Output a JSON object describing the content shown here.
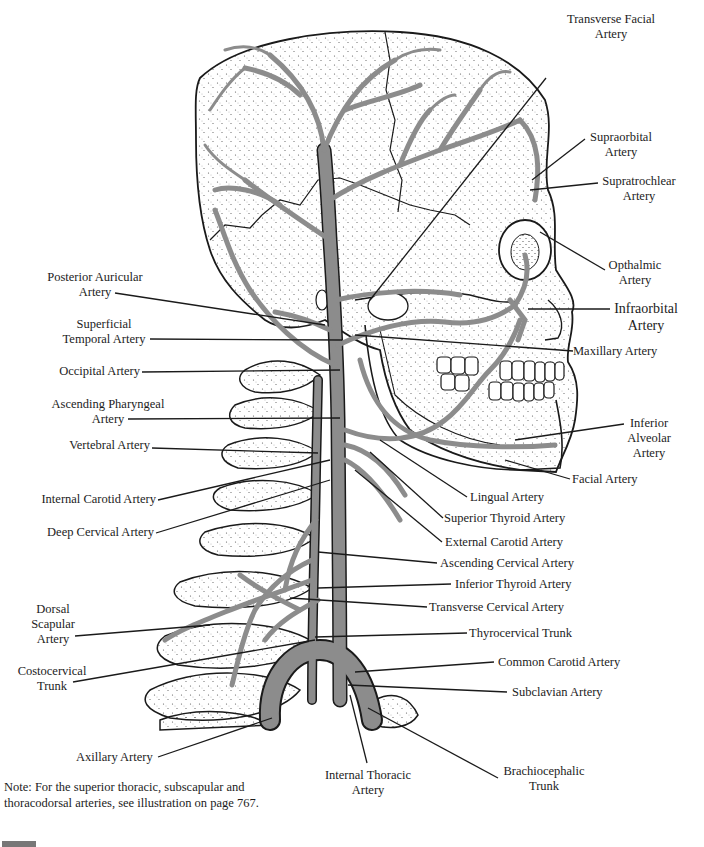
{
  "figure": {
    "colors": {
      "artery_fill": "#8c8c8c",
      "outline": "#1a1a1a",
      "stipple": "#555555",
      "background": "#ffffff",
      "page_tab": "#777777"
    }
  },
  "labels_right": [
    {
      "id": "transverse-facial",
      "line1": "Transverse Facial",
      "line2": "Artery"
    },
    {
      "id": "supraorbital",
      "line1": "Supraorbital",
      "line2": "Artery"
    },
    {
      "id": "supratrochlear",
      "line1": "Supratrochlear",
      "line2": "Artery"
    },
    {
      "id": "opthalmic",
      "line1": "Opthalmic",
      "line2": "Artery"
    },
    {
      "id": "infraorbital",
      "line1": "Infraorbital",
      "line2": "Artery"
    },
    {
      "id": "maxillary",
      "line1": "Maxillary Artery"
    },
    {
      "id": "inferior-alveolar",
      "line1": "Inferior",
      "line2": "Alveolar",
      "line3": "Artery"
    },
    {
      "id": "facial",
      "line1": "Facial Artery"
    },
    {
      "id": "lingual",
      "line1": "Lingual Artery"
    },
    {
      "id": "superior-thyroid",
      "line1": "Superior Thyroid Artery"
    },
    {
      "id": "external-carotid",
      "line1": "External Carotid Artery"
    },
    {
      "id": "ascending-cervical",
      "line1": "Ascending Cervical Artery"
    },
    {
      "id": "inferior-thyroid",
      "line1": "Inferior Thyroid Artery"
    },
    {
      "id": "transverse-cervical",
      "line1": "Transverse Cervical Artery"
    },
    {
      "id": "thyrocervical",
      "line1": "Thyrocervical Trunk"
    },
    {
      "id": "common-carotid",
      "line1": "Common Carotid Artery"
    },
    {
      "id": "subclavian",
      "line1": "Subclavian Artery"
    },
    {
      "id": "brachiocephalic",
      "line1": "Brachiocephalic",
      "line2": "Trunk"
    }
  ],
  "labels_left": [
    {
      "id": "posterior-auricular",
      "line1": "Posterior Auricular",
      "line2": "Artery"
    },
    {
      "id": "superficial-temporal",
      "line1": "Superficial",
      "line2": "Temporal Artery"
    },
    {
      "id": "occipital",
      "line1": "Occipital Artery"
    },
    {
      "id": "ascending-pharyngeal",
      "line1": "Ascending Pharyngeal",
      "line2": "Artery"
    },
    {
      "id": "vertebral",
      "line1": "Vertebral Artery"
    },
    {
      "id": "internal-carotid",
      "line1": "Internal Carotid Artery"
    },
    {
      "id": "deep-cervical",
      "line1": "Deep Cervical Artery"
    },
    {
      "id": "dorsal-scapular",
      "line1": "Dorsal",
      "line2": "Scapular",
      "line3": "Artery"
    },
    {
      "id": "costocervical",
      "line1": "Costocervical",
      "line2": "Trunk"
    }
  ],
  "labels_bottom": [
    {
      "id": "axillary",
      "line1": "Axillary Artery"
    },
    {
      "id": "internal-thoracic",
      "line1": "Internal Thoracic",
      "line2": "Artery"
    }
  ],
  "note": {
    "text": "Note:  For the superior thoracic, subscapular and thoracodorsal arteries, see illustration on page 767."
  }
}
